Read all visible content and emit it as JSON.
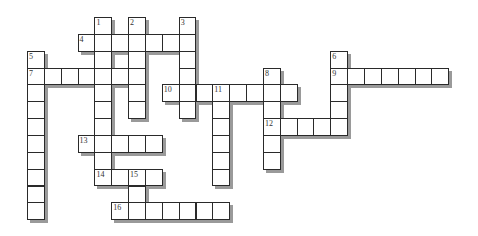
{
  "puzzle": {
    "type": "crossword",
    "cell_size": 16.85,
    "origin": {
      "x": 27,
      "y": 17
    },
    "colors": {
      "cell_border": "#2a2a2a",
      "cell_fill": "#ffffff",
      "shadow": "#9a9a9a",
      "number": "#333333"
    },
    "words": [
      {
        "num": "1",
        "dir": "down",
        "row": 0,
        "col": 4,
        "len": 10
      },
      {
        "num": "2",
        "dir": "down",
        "row": 0,
        "col": 6,
        "len": 6
      },
      {
        "num": "3",
        "dir": "down",
        "row": 0,
        "col": 9,
        "len": 6
      },
      {
        "num": "4",
        "dir": "across",
        "row": 1,
        "col": 3,
        "len": 7
      },
      {
        "num": "5",
        "dir": "down",
        "row": 2,
        "col": 0,
        "len": 10
      },
      {
        "num": "6",
        "dir": "down",
        "row": 2,
        "col": 18,
        "len": 5
      },
      {
        "num": "7",
        "dir": "across",
        "row": 3,
        "col": 0,
        "len": 7
      },
      {
        "num": "8",
        "dir": "down",
        "row": 3,
        "col": 14,
        "len": 6
      },
      {
        "num": "9",
        "dir": "across",
        "row": 3,
        "col": 18,
        "len": 7
      },
      {
        "num": "10",
        "dir": "across",
        "row": 4,
        "col": 8,
        "len": 8
      },
      {
        "num": "11",
        "dir": "down",
        "row": 4,
        "col": 11,
        "len": 6
      },
      {
        "num": "12",
        "dir": "across",
        "row": 6,
        "col": 14,
        "len": 5
      },
      {
        "num": "13",
        "dir": "across",
        "row": 7,
        "col": 3,
        "len": 5
      },
      {
        "num": "14",
        "dir": "across",
        "row": 9,
        "col": 4,
        "len": 4
      },
      {
        "num": "15",
        "dir": "down",
        "row": 9,
        "col": 6,
        "len": 3
      },
      {
        "num": "16",
        "dir": "across",
        "row": 11,
        "col": 5,
        "len": 7
      }
    ]
  }
}
